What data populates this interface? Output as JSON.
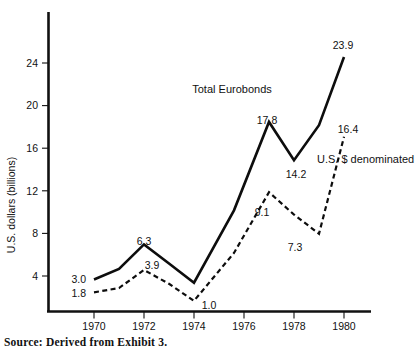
{
  "figure": {
    "source_note": "Source: Derived from Exhibit 3.",
    "y_axis_title": "U.S. dollars (billions)"
  },
  "chart_data": {
    "type": "line",
    "title": "",
    "xlabel": "",
    "ylabel": "U.S. dollars (billions)",
    "x": [
      1970,
      1971,
      1972,
      1973,
      1974,
      1975,
      1976,
      1977,
      1978,
      1979,
      1980
    ],
    "xlim": [
      1969.3,
      1981.0
    ],
    "ylim": [
      0,
      26.5
    ],
    "xticks": [
      1970,
      1972,
      1974,
      1976,
      1978,
      1980
    ],
    "xticklabels": [
      "1970",
      "1972",
      "1974",
      "1976",
      "1978",
      "1980"
    ],
    "yticks": [
      4,
      8,
      12,
      16,
      20,
      24
    ],
    "yticklabels": [
      "4",
      "8",
      "12",
      "16",
      "20",
      "24"
    ],
    "grid": false,
    "legend_position": "inline-annotations",
    "series": [
      {
        "name": "Total Eurobonds",
        "style": "solid",
        "label_text": "Total Eurobonds",
        "values": [
          3.0,
          4.0,
          6.3,
          4.5,
          2.7,
          9.5,
          17.8,
          14.2,
          17.5,
          23.9
        ],
        "x_values": [
          1970,
          1971,
          1972,
          1973,
          1974,
          1975.6,
          1977,
          1978,
          1979,
          1980
        ],
        "point_labels": [
          {
            "text": "3.0",
            "x": 1970,
            "y": 3.0
          },
          {
            "text": "6.3",
            "x": 1972,
            "y": 6.3
          },
          {
            "text": "17.8",
            "x": 1977,
            "y": 17.8
          },
          {
            "text": "14.2",
            "x": 1978,
            "y": 14.2
          },
          {
            "text": "23.9",
            "x": 1980,
            "y": 23.9
          }
        ]
      },
      {
        "name": "U.S. $ denominated",
        "style": "dashed",
        "label_text": "U.S. $ denominated",
        "values": [
          1.8,
          2.2,
          3.9,
          2.6,
          1.0,
          5.5,
          11.2,
          9.1,
          7.3,
          16.4
        ],
        "x_values": [
          1970,
          1971,
          1972,
          1973,
          1974,
          1975.6,
          1977,
          1978,
          1979,
          1980
        ],
        "point_labels": [
          {
            "text": "1.8",
            "x": 1970,
            "y": 1.8
          },
          {
            "text": "3.9",
            "x": 1972,
            "y": 3.9
          },
          {
            "text": "1.0",
            "x": 1974,
            "y": 1.0
          },
          {
            "text": "9.1",
            "x": 1977,
            "y": 9.1
          },
          {
            "text": "7.3",
            "x": 1979,
            "y": 7.3
          },
          {
            "text": "16.4",
            "x": 1980,
            "y": 16.4
          }
        ]
      }
    ],
    "annotations": [
      {
        "name": "total-eurobonds-label",
        "text": "Total Eurobonds"
      },
      {
        "name": "usd-denominated-label",
        "text": "U.S. $ denominated"
      }
    ]
  },
  "labels": {
    "y_ticks": {
      "t24": "24",
      "t20": "20",
      "t16": "16",
      "t12": "12",
      "t8": "8",
      "t4": "4"
    },
    "x_ticks": {
      "t1970": "1970",
      "t1972": "1972",
      "t1974": "1974",
      "t1976": "1976",
      "t1978": "1978",
      "t1980": "1980"
    },
    "points": {
      "p30": "3.0",
      "p18": "1.8",
      "p63": "6.3",
      "p39": "3.9",
      "p10": "1.0",
      "p178": "17.8",
      "p142": "14.2",
      "p91": "9.1",
      "p73": "7.3",
      "p239": "23.9",
      "p164": "16.4"
    },
    "series": {
      "total": "Total Eurobonds",
      "usd": "U.S. $ denominated"
    }
  }
}
